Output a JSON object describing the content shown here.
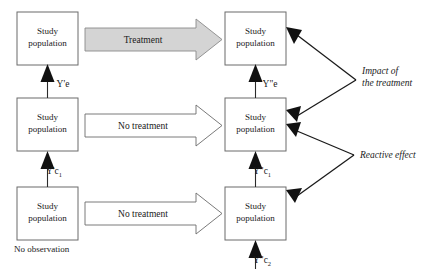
{
  "diagram": {
    "colors": {
      "treatment_arrow_fill": "#d4d4d4",
      "no_treatment_arrow_fill": "#ffffff",
      "box_border": "#6b6b6b",
      "line": "#1a1a1a",
      "background": "#ffffff"
    },
    "boxes": [
      {
        "id": "left-top",
        "line1": "Study",
        "line2": "population"
      },
      {
        "id": "left-middle",
        "line1": "Study",
        "line2": "population"
      },
      {
        "id": "left-bottom",
        "line1": "Study",
        "line2": "population"
      },
      {
        "id": "right-top",
        "line1": "Study",
        "line2": "population"
      },
      {
        "id": "right-middle",
        "line1": "Study",
        "line2": "population"
      },
      {
        "id": "right-bottom",
        "line1": "Study",
        "line2": "population"
      }
    ],
    "flow_arrows": [
      {
        "id": "treatment",
        "label": "Treatment",
        "style": "gray"
      },
      {
        "id": "no-treatment-mid",
        "label": "No treatment",
        "style": "white"
      },
      {
        "id": "no-treatment-bot",
        "label": "No treatment",
        "style": "white"
      }
    ],
    "vertical_arrow_labels": [
      {
        "id": "left-upper",
        "base": "Y'e",
        "sub": ""
      },
      {
        "id": "left-lower",
        "base": "Y'c",
        "sub": "1"
      },
      {
        "id": "right-upper",
        "base": "Y\"e",
        "sub": ""
      },
      {
        "id": "right-middle",
        "base": "Y\"c",
        "sub": "1"
      },
      {
        "id": "right-lower",
        "base": "Y\"c",
        "sub": "2"
      }
    ],
    "annotations": [
      {
        "id": "impact",
        "line1": "Impact of",
        "line2": "the treatment"
      },
      {
        "id": "reactive",
        "line1": "Reactive effect",
        "line2": ""
      }
    ],
    "notes": [
      {
        "id": "no-observation",
        "text": "No observation"
      }
    ]
  }
}
